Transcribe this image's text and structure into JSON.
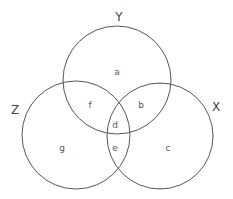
{
  "diagram": {
    "type": "venn-3",
    "stroke_color": "#555555",
    "sets": [
      {
        "name": "Y",
        "label": "Y",
        "cx": 117,
        "cy": 80,
        "r": 54,
        "label_x": 119,
        "label_y": 21
      },
      {
        "name": "Z",
        "label": "Z",
        "cx": 76,
        "cy": 135,
        "r": 54,
        "label_x": 15,
        "label_y": 114
      },
      {
        "name": "X",
        "label": "X",
        "cx": 160,
        "cy": 136,
        "r": 53,
        "label_x": 216,
        "label_y": 111
      }
    ],
    "regions": [
      {
        "id": "a",
        "label": "a",
        "sets": [
          "Y"
        ],
        "x": 117,
        "y": 75
      },
      {
        "id": "b",
        "label": "b",
        "sets": [
          "Y",
          "X"
        ],
        "x": 141,
        "y": 108
      },
      {
        "id": "c",
        "label": "c",
        "sets": [
          "X"
        ],
        "x": 168,
        "y": 151
      },
      {
        "id": "d",
        "label": "d",
        "sets": [
          "X",
          "Y",
          "Z"
        ],
        "x": 115,
        "y": 128
      },
      {
        "id": "e",
        "label": "e",
        "sets": [
          "X",
          "Z"
        ],
        "x": 115,
        "y": 151
      },
      {
        "id": "f",
        "label": "f",
        "sets": [
          "Y",
          "Z"
        ],
        "x": 90,
        "y": 108
      },
      {
        "id": "g",
        "label": "g",
        "sets": [
          "Z"
        ],
        "x": 62,
        "y": 151
      }
    ]
  }
}
